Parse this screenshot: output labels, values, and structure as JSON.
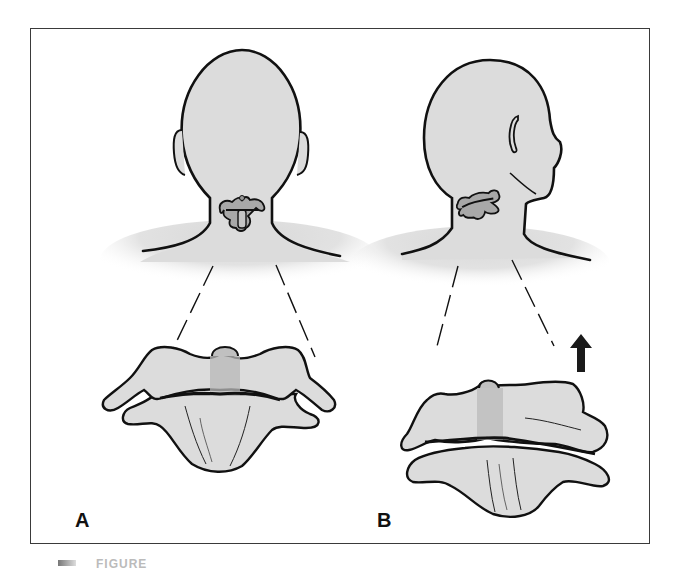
{
  "figure": {
    "panels": [
      {
        "id": "A",
        "label": "A",
        "view": "posterior view of head and neck",
        "inset": "cervical vertebra (atlas/axis) in neutral alignment"
      },
      {
        "id": "B",
        "label": "B",
        "view": "rotated head, posterior-oblique view",
        "inset": "cervical vertebra rotated with upward displacement",
        "arrow": "up-arrow"
      }
    ],
    "caption": {
      "text": "FIGURE",
      "truncated": true
    },
    "colors": {
      "outline": "#111111",
      "fill": "#dcdcdc",
      "shade": "#c4c4c4",
      "frame": "#3a3a3a"
    }
  }
}
